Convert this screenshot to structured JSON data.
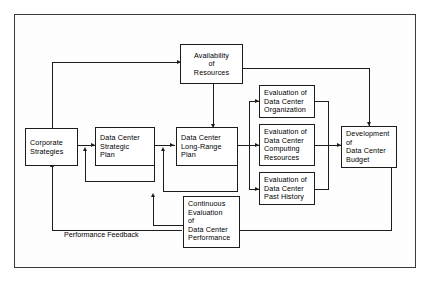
{
  "diagram": {
    "type": "flowchart",
    "nodes": {
      "availability_of_resources": "Availability\nof\nResources",
      "corporate_strategies": "Corporate\nStrategies",
      "data_center_strategic_plan": "Data Center\nStrategic\nPlan",
      "data_center_long_range_plan": "Data  Center\nLong-Range\nPlan",
      "evaluation_organization": "Evaluation of\nData Center\nOrganization",
      "evaluation_computing_resources": "Evaluation of\nData Center\nComputing\nResources",
      "evaluation_past_history": "Evaluation of\nData Center\nPast History",
      "development_budget": "Development\nof\nData Center\nBudget",
      "continuous_evaluation": "Continuous\nEvaluation\nof\nData Center\nPerformance"
    },
    "edge_labels": {
      "performance_feedback": "Performance Feedback"
    },
    "colors": {
      "line": "#1c1c1c",
      "box_fill": "#ffffff",
      "frame": "#3a3a3a",
      "page": "#fdfdfd",
      "text": "#000000"
    }
  }
}
